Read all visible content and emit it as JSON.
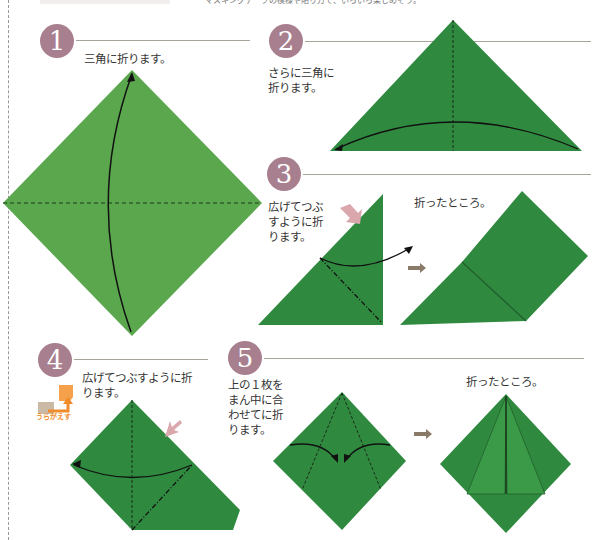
{
  "header": {
    "caption": "マスキングテープの模様や貼り方で、いろいろ楽しめそう。"
  },
  "colors": {
    "step_badge": "#a87f8e",
    "paper_light": "#5aa74e",
    "paper_dark": "#2f8a3f",
    "rule": "#a9a49a",
    "orange": "#f08c2a"
  },
  "steps": [
    {
      "number": "1",
      "text": "三角に折ります。"
    },
    {
      "number": "2",
      "text_lines": [
        "さらに三角に",
        "折ります。"
      ]
    },
    {
      "number": "3",
      "text_lines": [
        "広げてつぶ",
        "すように折",
        "ります。"
      ],
      "result_text": "折ったところ。"
    },
    {
      "number": "4",
      "text_lines": [
        "広げてつぶすように折",
        "ります。"
      ],
      "flip_label": "うらがえす"
    },
    {
      "number": "5",
      "text_lines": [
        "上の１枚を",
        "まん中に合",
        "わせてに折",
        "ります。"
      ],
      "result_text": "折ったところ。"
    }
  ]
}
